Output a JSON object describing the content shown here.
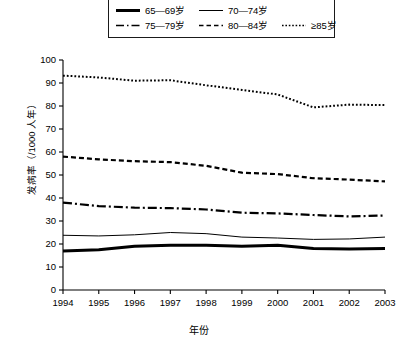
{
  "chart_data": {
    "type": "line",
    "title": "",
    "xlabel": "年份",
    "ylabel": "发病率（/1000 人年）",
    "x": [
      1994,
      1995,
      1996,
      1997,
      1998,
      1999,
      2000,
      2001,
      2002,
      2003
    ],
    "xtick_labels": [
      "1994",
      "1995",
      "1996",
      "1997",
      "1998",
      "1999",
      "2000",
      "2001",
      "2002",
      "2003"
    ],
    "ytick_labels": [
      "0",
      "10",
      "20",
      "30",
      "40",
      "50",
      "60",
      "70",
      "80",
      "90",
      "100"
    ],
    "ylim": [
      0,
      100
    ],
    "ytick_step": 10,
    "grid": false,
    "legend_position": "top",
    "series": [
      {
        "name": "65—69岁",
        "style": "solid-thick",
        "values": [
          17.0,
          17.5,
          19.0,
          19.5,
          19.5,
          19.0,
          19.5,
          18.0,
          17.8,
          18.0
        ]
      },
      {
        "name": "70—74岁",
        "style": "solid-thin",
        "values": [
          23.8,
          23.5,
          24.0,
          25.0,
          24.5,
          23.0,
          22.6,
          22.0,
          22.2,
          23.0
        ]
      },
      {
        "name": "75—79岁",
        "style": "dash-dot",
        "values": [
          38.0,
          36.5,
          35.8,
          35.6,
          35.0,
          33.6,
          33.3,
          32.6,
          32.0,
          32.4
        ]
      },
      {
        "name": "80—84岁",
        "style": "dashed",
        "values": [
          58.0,
          56.8,
          56.0,
          55.6,
          54.0,
          51.0,
          50.4,
          48.6,
          48.0,
          47.2
        ]
      },
      {
        "name": "≥85岁",
        "style": "dotted",
        "values": [
          93.2,
          92.4,
          91.0,
          91.2,
          89.0,
          87.0,
          85.0,
          79.4,
          80.6,
          80.4
        ]
      }
    ]
  },
  "legend": {
    "rows": [
      [
        {
          "label": "65—69岁",
          "style": "solid-thick"
        },
        {
          "label": "70—74岁",
          "style": "solid-thin"
        }
      ],
      [
        {
          "label": "75—79岁",
          "style": "dash-dot"
        },
        {
          "label": "80—84岁",
          "style": "dashed"
        },
        {
          "label": "≥85岁",
          "style": "dotted"
        }
      ]
    ]
  },
  "colors": {
    "line": "#000000",
    "axis": "#000000",
    "background": "#ffffff"
  }
}
